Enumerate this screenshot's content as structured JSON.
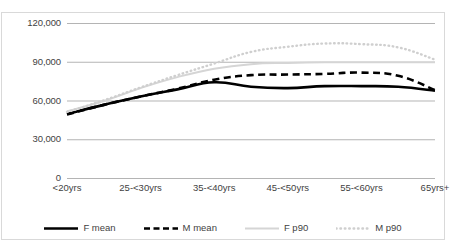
{
  "chart_data": {
    "type": "line",
    "title": "",
    "xlabel": "",
    "ylabel": "",
    "ylim": [
      0,
      120000
    ],
    "yticks": [
      0,
      30000,
      60000,
      90000,
      120000
    ],
    "ytick_labels": [
      "0",
      "30,000",
      "60,000",
      "90,000",
      "120,000"
    ],
    "grid": true,
    "grid_axis": "y",
    "legend_position": "bottom",
    "categories": [
      "<20yrs",
      "20-<25yrs",
      "25-<30yrs",
      "30-<35yrs",
      "35-<40yrs",
      "40-<45yrs",
      "45-<50yrs",
      "50-<55yrs",
      "55-<60yrs",
      "60-<65yrs",
      "65yrs+"
    ],
    "visible_xtick_labels": [
      "<20yrs",
      "25-<30yrs",
      "35-<40yrs",
      "45-<50yrs",
      "55-<60yrs",
      "65yrs+"
    ],
    "series": [
      {
        "name": "F mean",
        "style": "solid",
        "color": "#000000",
        "width": 2.6,
        "values": [
          50000,
          57000,
          63500,
          69000,
          74500,
          71000,
          70000,
          71500,
          71500,
          71000,
          68000
        ]
      },
      {
        "name": "M mean",
        "style": "dashed",
        "color": "#000000",
        "width": 2.6,
        "values": [
          49500,
          57000,
          63500,
          69500,
          76500,
          80000,
          80500,
          81000,
          82000,
          79500,
          68500
        ]
      },
      {
        "name": "F p90",
        "style": "solid",
        "color": "#d5d5d5",
        "width": 2.0,
        "values": [
          52000,
          60000,
          70000,
          78500,
          85000,
          88500,
          89500,
          90000,
          90000,
          90000,
          90000
        ]
      },
      {
        "name": "M p90",
        "style": "dotted",
        "color": "#cfcfcf",
        "width": 2.4,
        "values": [
          51500,
          60500,
          70500,
          80000,
          89000,
          98000,
          102000,
          104500,
          104000,
          101500,
          92000
        ]
      }
    ]
  },
  "legend": {
    "items": [
      {
        "label": "F mean",
        "key": "solid-black-key"
      },
      {
        "label": "M mean",
        "key": "dashed-black-key"
      },
      {
        "label": "F p90",
        "key": "solid-gray-key"
      },
      {
        "label": "M p90",
        "key": "dotted-gray-key"
      }
    ]
  }
}
